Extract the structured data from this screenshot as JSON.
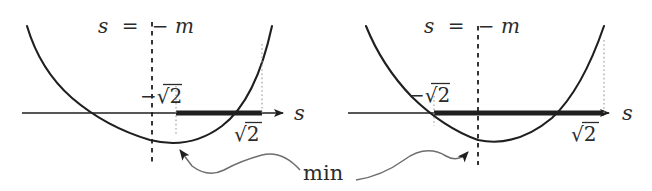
{
  "figure": {
    "name": "parabola-sign-region-pair",
    "background_color": "#ffffff",
    "ink_color": "#2b2b2b",
    "thin_color": "#6e6e6e",
    "panels": [
      {
        "id": "left",
        "axis_label": "s",
        "vertical_line_label": "s = −m",
        "left_root_label": "−√2",
        "right_root_label": "√2",
        "vertical_line_style": "dashed",
        "drop_line_style": "dotted",
        "highlight_segment": "thick",
        "vertex_on_dashed_line": true
      },
      {
        "id": "right",
        "axis_label": "s",
        "vertical_line_label": "s = −m",
        "left_root_label": "−√2",
        "right_root_label": "√2",
        "vertical_line_style": "dashed",
        "drop_line_style": "dotted",
        "highlight_segment": "thick",
        "vertex_on_dashed_line": true
      }
    ],
    "annotation": {
      "label": "min",
      "points_to": [
        "left-panel-minimum",
        "right-panel-minimum"
      ],
      "connector_style": "wavy-curve-with-arrowhead"
    },
    "glyphs": {
      "minus": "−",
      "radical": "√",
      "equals": "=",
      "s": "s",
      "m": "m",
      "two": "2"
    }
  }
}
